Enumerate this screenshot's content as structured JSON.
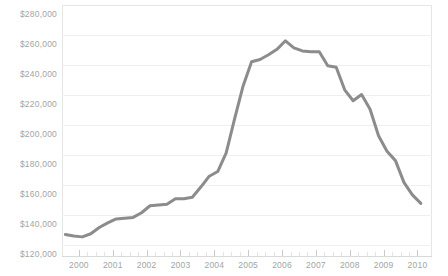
{
  "chart_data": {
    "type": "line",
    "title": "",
    "subtitle": "",
    "xlabel": "",
    "ylabel": "",
    "xlim": [
      1999.5,
      2010.4
    ],
    "ylim": [
      120000,
      280000
    ],
    "grid": true,
    "legend": null,
    "y_tick_labels": [
      "$280,000",
      "$260,000",
      "$240,000",
      "$220,000",
      "$200,000",
      "$180,000",
      "$160,000",
      "$140,000",
      "$120,000"
    ],
    "y_tick_values": [
      280000,
      260000,
      240000,
      220000,
      200000,
      180000,
      160000,
      140000,
      120000
    ],
    "x_tick_labels": [
      "2000",
      "2001",
      "2002",
      "2003",
      "2004",
      "2005",
      "2006",
      "2007",
      "2008",
      "2009",
      "2010"
    ],
    "x_tick_values": [
      2000,
      2001,
      2002,
      2003,
      2004,
      2005,
      2006,
      2007,
      2008,
      2009,
      2010
    ],
    "series": [
      {
        "name": "Median home price",
        "color": "#8c8c8c",
        "x": [
          1999.6,
          1999.85,
          2000.1,
          2000.35,
          2000.6,
          2000.85,
          2001.1,
          2001.35,
          2001.6,
          2001.85,
          2002.1,
          2002.35,
          2002.6,
          2002.85,
          2003.1,
          2003.35,
          2003.6,
          2003.85,
          2004.1,
          2004.35,
          2004.6,
          2004.85,
          2005.1,
          2005.35,
          2005.6,
          2005.85,
          2006.1,
          2006.35,
          2006.6,
          2006.85,
          2007.1,
          2007.35,
          2007.6,
          2007.85,
          2008.1,
          2008.35,
          2008.6,
          2008.85,
          2009.1,
          2009.35,
          2009.6,
          2009.85,
          2010.1
        ],
        "values": [
          132500,
          131500,
          131000,
          133000,
          137000,
          140000,
          142500,
          143000,
          143500,
          146500,
          151000,
          151500,
          152000,
          155500,
          155500,
          156500,
          163000,
          170000,
          173000,
          185000,
          207000,
          228000,
          243500,
          245000,
          248000,
          251500,
          257000,
          252500,
          250500,
          250000,
          250000,
          241000,
          240000,
          225500,
          218500,
          222500,
          213000,
          196000,
          186000,
          180000,
          166000,
          158000,
          152500
        ],
        "min_value": 131000,
        "max_value": 257000,
        "first_value": 132500,
        "last_value": 152500
      }
    ]
  }
}
